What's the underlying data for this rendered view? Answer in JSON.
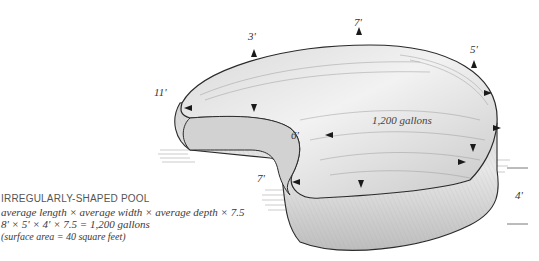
{
  "diagram": {
    "subject": "irregularly-shaped pool",
    "volume_label": "1,200 gallons",
    "dimension_labels": {
      "top_left": "3'",
      "top_center": "7'",
      "top_right": "5'",
      "left": "11'",
      "inner_notch": "6'",
      "lower_left": "7'",
      "depth": "4'"
    }
  },
  "caption": {
    "title": "IRREGULARLY-SHAPED POOL",
    "formula": "average length × average width × average depth × 7.5",
    "calculation": "8' × 5' × 4' × 7.5 = 1,200 gallons",
    "note": "(surface area = 40 square feet)"
  },
  "colors": {
    "outline": "#2a2a2a",
    "shading": "#8c8c8c",
    "paper": "#ffffff"
  }
}
